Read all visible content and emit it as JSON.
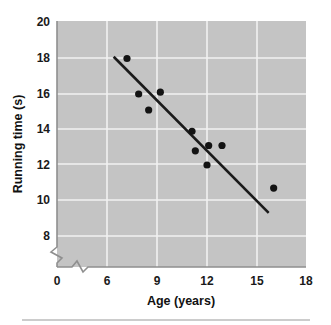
{
  "chart_data": {
    "type": "scatter",
    "title": "",
    "xlabel": "Age (years)",
    "ylabel": "Running time (s)",
    "xlim": [
      6,
      18
    ],
    "ylim": [
      8,
      20
    ],
    "xticks": [
      0,
      6,
      9,
      12,
      15,
      18
    ],
    "yticks": [
      8,
      10,
      12,
      14,
      16,
      18,
      20
    ],
    "xtick_labels": [
      "0",
      "6",
      "9",
      "12",
      "15",
      "18"
    ],
    "ytick_labels": [
      "8",
      "10",
      "12",
      "14",
      "16",
      "18",
      "20"
    ],
    "grid": true,
    "legend": "none",
    "axis_break_x": true,
    "axis_break_y": true,
    "plot_background": "#c4c4c4",
    "point_color": "#131313",
    "line_color": "#1a1a1a",
    "grid_color": "#f2f2f2",
    "x": [
      7.2,
      7.9,
      8.5,
      9.2,
      11.1,
      11.3,
      12.0,
      12.1,
      12.9,
      16.0
    ],
    "y": [
      18.0,
      16.0,
      15.1,
      16.1,
      13.9,
      12.8,
      12.0,
      13.1,
      13.1,
      10.7
    ],
    "points": [
      {
        "x": 7.2,
        "y": 18.0
      },
      {
        "x": 7.9,
        "y": 16.0
      },
      {
        "x": 8.5,
        "y": 15.1
      },
      {
        "x": 9.2,
        "y": 16.1
      },
      {
        "x": 11.1,
        "y": 13.9
      },
      {
        "x": 11.3,
        "y": 12.8
      },
      {
        "x": 12.0,
        "y": 12.0
      },
      {
        "x": 12.1,
        "y": 13.1
      },
      {
        "x": 12.9,
        "y": 13.1
      },
      {
        "x": 16.0,
        "y": 10.7
      }
    ],
    "trend_line": {
      "x0": 6.4,
      "y0": 18.1,
      "x1": 15.7,
      "y1": 9.3
    }
  }
}
